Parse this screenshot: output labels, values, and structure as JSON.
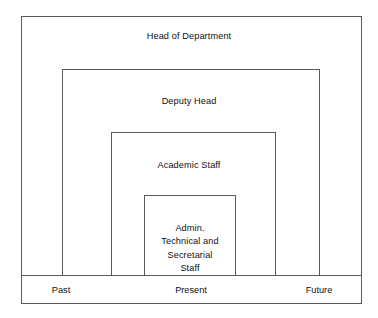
{
  "diagram": {
    "type": "nested-rectangles-timeline",
    "background_color": "#ffffff",
    "line_color": "#555b5e",
    "text_color": "#111111",
    "bands": [
      {
        "id": "head-of-department",
        "label": "Head of Department",
        "level": 1,
        "rect": {
          "x": 21,
          "y": 16,
          "width": 341,
          "height": 288
        }
      },
      {
        "id": "deputy-head",
        "label": "Deputy Head",
        "level": 2,
        "rect": {
          "x": 62,
          "y": 69,
          "width": 258,
          "height": 206
        }
      },
      {
        "id": "academic-staff",
        "label": "Academic Staff",
        "level": 3,
        "rect": {
          "x": 111,
          "y": 132,
          "width": 165,
          "height": 143
        }
      },
      {
        "id": "admin-technical-secretarial-staff",
        "label": "Admin. Technical and Secretarial Staff",
        "label_lines": [
          "Admin.",
          "Technical and",
          "Secretarial",
          "Staff"
        ],
        "level": 4,
        "rect": {
          "x": 144,
          "y": 195,
          "width": 92,
          "height": 80
        }
      }
    ],
    "axis": {
      "divider_y": 275,
      "labels": [
        {
          "id": "past",
          "text": "Past"
        },
        {
          "id": "present",
          "text": "Present"
        },
        {
          "id": "future",
          "text": "Future"
        }
      ]
    }
  }
}
